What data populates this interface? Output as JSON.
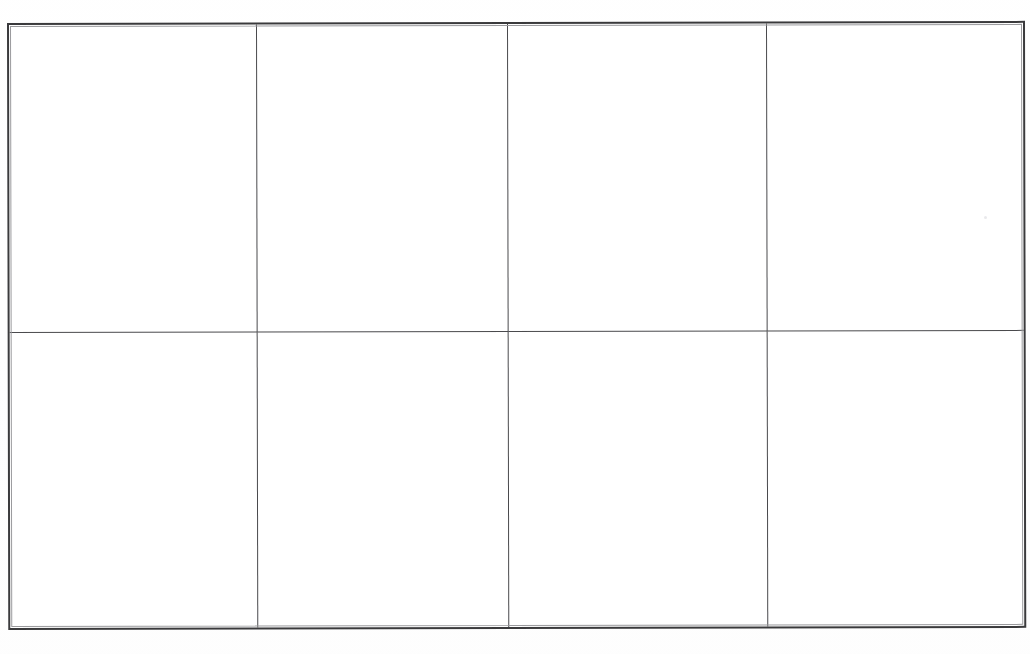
{
  "document": {
    "kind": "scanned-blank-table",
    "page_background_color": "#fefefe",
    "cell_background_color": "#ffffff",
    "outer_border_color": "#3a3a3c",
    "inner_rule_color": "#4a4a4d",
    "artifact_color": "#e9e9ec"
  },
  "table": {
    "caption": "",
    "column_count": 4,
    "row_count": 2,
    "headers": [
      "",
      "",
      "",
      ""
    ],
    "rows": [
      {
        "cells": [
          "",
          "",
          "",
          ""
        ]
      },
      {
        "cells": [
          "",
          "",
          "",
          ""
        ]
      }
    ]
  },
  "artifacts": [
    {
      "name": "speck-upper-right",
      "label": ""
    }
  ]
}
